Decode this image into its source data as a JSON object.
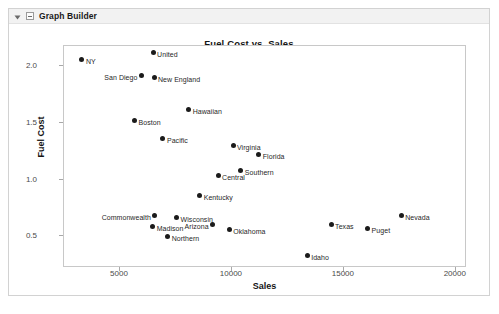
{
  "window": {
    "title": "Graph Builder",
    "disclosure_icon": "triangle-down-icon",
    "collapse_icon": "minus-box-icon"
  },
  "chart_data": {
    "type": "scatter",
    "title": "Fuel Cost vs. Sales",
    "xlabel": "Sales",
    "ylabel": "Fuel Cost",
    "xlim": [
      2500,
      20500
    ],
    "ylim": [
      0.22,
      2.18
    ],
    "xticks": [
      5000,
      10000,
      15000,
      20000
    ],
    "yticks": [
      "0.5",
      "1.0",
      "1.5",
      "2.0"
    ],
    "ytick_values": [
      0.5,
      1.0,
      1.5,
      2.0
    ],
    "grid": false,
    "legend": "none",
    "marker_color": "#1b1b1b",
    "points": [
      {
        "label": "NY",
        "x": 3300,
        "y": 2.06,
        "side": "right"
      },
      {
        "label": "United",
        "x": 6480,
        "y": 2.12,
        "side": "right"
      },
      {
        "label": "San Diego",
        "x": 5960,
        "y": 1.92,
        "side": "left"
      },
      {
        "label": "New England",
        "x": 6520,
        "y": 1.9,
        "side": "right"
      },
      {
        "label": "Hawaiian",
        "x": 8070,
        "y": 1.62,
        "side": "right"
      },
      {
        "label": "Boston",
        "x": 5650,
        "y": 1.52,
        "side": "right"
      },
      {
        "label": "Pacific",
        "x": 6920,
        "y": 1.36,
        "side": "right"
      },
      {
        "label": "Virginia",
        "x": 10050,
        "y": 1.3,
        "side": "right"
      },
      {
        "label": "Florida",
        "x": 11200,
        "y": 1.22,
        "side": "right"
      },
      {
        "label": "Southern",
        "x": 10400,
        "y": 1.08,
        "side": "right"
      },
      {
        "label": "Central",
        "x": 9380,
        "y": 1.04,
        "side": "right"
      },
      {
        "label": "Kentucky",
        "x": 8560,
        "y": 0.86,
        "side": "right"
      },
      {
        "label": "Commonwealth",
        "x": 6560,
        "y": 0.68,
        "side": "left"
      },
      {
        "label": "Wisconsin",
        "x": 7530,
        "y": 0.67,
        "side": "right"
      },
      {
        "label": "Madison",
        "x": 6460,
        "y": 0.59,
        "side": "right"
      },
      {
        "label": "Arizona",
        "x": 9140,
        "y": 0.6,
        "side": "left"
      },
      {
        "label": "Oklahoma",
        "x": 9880,
        "y": 0.56,
        "side": "right"
      },
      {
        "label": "Northern",
        "x": 7130,
        "y": 0.5,
        "side": "right"
      },
      {
        "label": "Texas",
        "x": 14430,
        "y": 0.6,
        "side": "right"
      },
      {
        "label": "Puget",
        "x": 16060,
        "y": 0.57,
        "side": "right"
      },
      {
        "label": "Nevada",
        "x": 17560,
        "y": 0.68,
        "side": "right"
      },
      {
        "label": "Idaho",
        "x": 13360,
        "y": 0.33,
        "side": "right"
      }
    ]
  }
}
